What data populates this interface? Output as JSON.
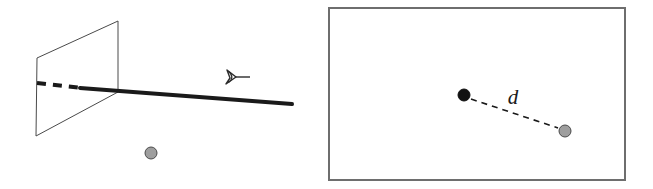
{
  "figure": {
    "title": "",
    "panels": [
      {
        "id": "left",
        "name": "3d-scene-panel",
        "has_border": false,
        "description": "3D perspective view: a viewing plane, a ray of sight from a camera, and a scene point",
        "elements": {
          "plane": {
            "name": "image-plane",
            "stroke_color": "#4a4a4a",
            "fill": "none",
            "stroke_width": 1,
            "points": "37,58 118,21 118,92 36,136"
          },
          "dashed_ray": {
            "name": "occluded-ray-segment",
            "stroke_color": "#1a1a1a",
            "stroke_width": 4,
            "dash_pattern": "9 7",
            "x1": 37,
            "y1": 83,
            "x2": 82,
            "y2": 88
          },
          "solid_ray": {
            "name": "visible-ray-segment",
            "stroke_color": "#1a1a1a",
            "stroke_width": 4,
            "x1": 80,
            "y1": 88,
            "x2": 292,
            "y2": 104
          },
          "camera": {
            "name": "camera-viewpoint-icon",
            "stroke_color": "#2b2b2b",
            "x": 236,
            "y": 77
          },
          "scene_point": {
            "name": "gray-scene-point",
            "fill_color": "#9e9e9e",
            "stroke_color": "#4a4a4a",
            "cx": 151,
            "cy": 153,
            "r": 6
          }
        }
      },
      {
        "id": "right",
        "name": "image-plane-panel",
        "has_border": true,
        "description": "2D image plane showing two projected points separated by distance d",
        "elements": {
          "border": {
            "name": "panel-border",
            "stroke_color": "#6e6e6e",
            "stroke_width": 2,
            "x": 329,
            "y": 8,
            "width": 296,
            "height": 172
          },
          "black_point": {
            "name": "black-projected-point",
            "fill_color": "#111111",
            "stroke_color": "#111111",
            "cx": 464,
            "cy": 95,
            "r": 6
          },
          "gray_point": {
            "name": "gray-projected-point",
            "fill_color": "#9e9e9e",
            "stroke_color": "#4a4a4a",
            "cx": 565,
            "cy": 131,
            "r": 6
          },
          "distance_line": {
            "name": "distance-dashed-line",
            "stroke_color": "#1a1a1a",
            "stroke_width": 1.6,
            "dash_pattern": "6 5",
            "x1": 471,
            "y1": 99,
            "x2": 558,
            "y2": 128
          },
          "distance_label": {
            "name": "distance-label",
            "text": "d",
            "color": "#1a1a1a",
            "x": 513,
            "y": 104
          }
        }
      }
    ]
  }
}
